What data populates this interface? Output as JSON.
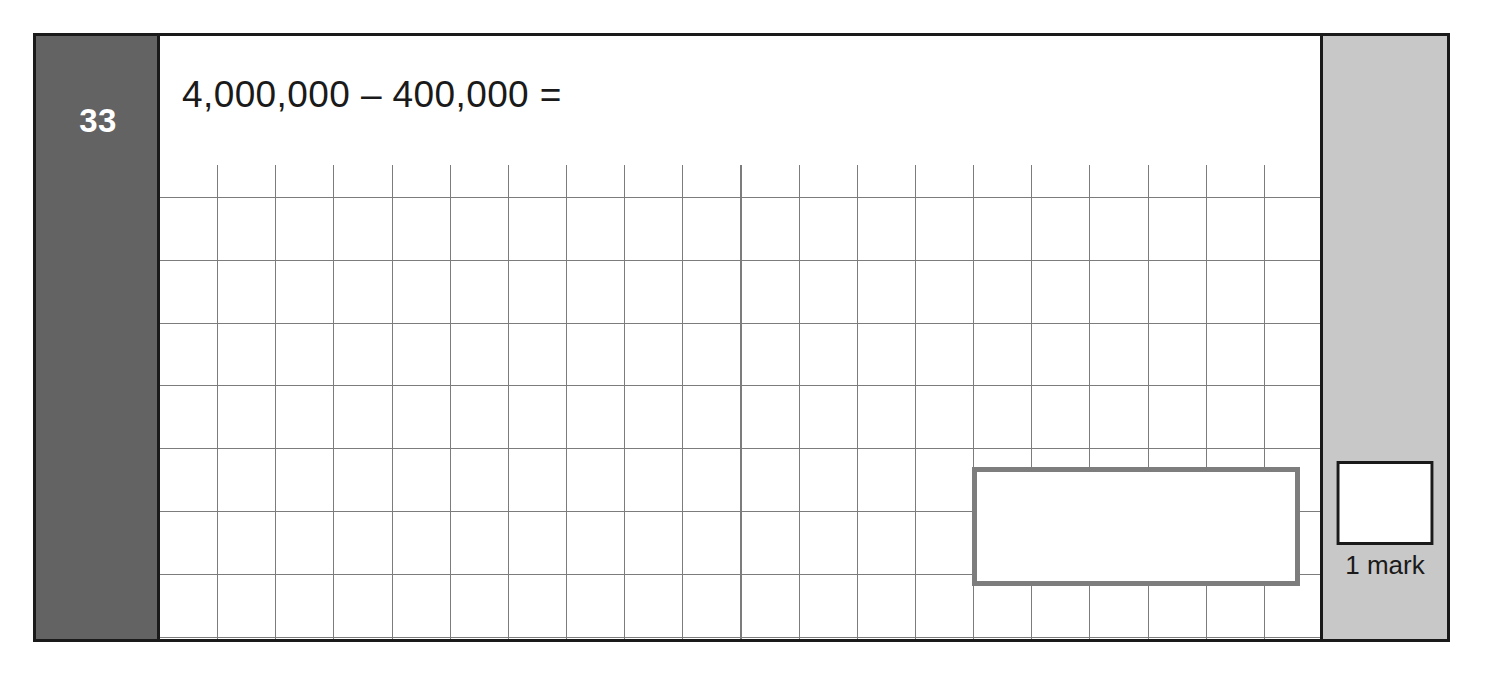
{
  "question": {
    "number": "33",
    "prompt": "4,000,000 – 400,000 ="
  },
  "answer": {
    "value": "",
    "placeholder": ""
  },
  "marking": {
    "score_value": "",
    "label": "1 mark"
  },
  "grid": {
    "columns": 20,
    "rows": 8
  },
  "colors": {
    "frame": "#1a1a1a",
    "number_column": "#636363",
    "mark_column": "#c8c8c8",
    "grid_line": "#7c7c7c",
    "answer_box_border": "#7d7d7d",
    "page_background": "#ffffff"
  }
}
